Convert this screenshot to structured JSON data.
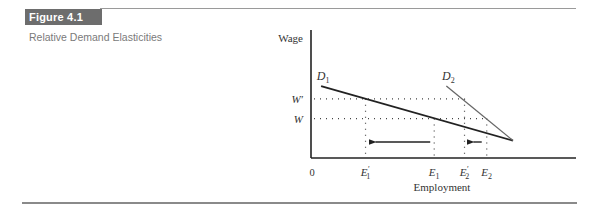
{
  "figure": {
    "label": "Figure 4.1",
    "title": "Relative Demand Elasticities"
  },
  "chart_data": {
    "type": "line",
    "title": "Relative Demand Elasticities",
    "xlabel": "Employment",
    "ylabel": "Wage",
    "origin_label": "0",
    "y_ticks": [
      {
        "label": "W'",
        "level": "high"
      },
      {
        "label": "W",
        "level": "low"
      }
    ],
    "x_ticks": [
      {
        "label": "E1'",
        "base": "E",
        "sub": "1",
        "prime": true
      },
      {
        "label": "E1",
        "base": "E",
        "sub": "1",
        "prime": false
      },
      {
        "label": "E2'",
        "base": "E",
        "sub": "2",
        "prime": true
      },
      {
        "label": "E2",
        "base": "E",
        "sub": "2",
        "prime": false
      }
    ],
    "series": [
      {
        "name": "D1",
        "base": "D",
        "sub": "1",
        "description": "Relatively elastic demand curve (flat)",
        "points": [
          [
            0.05,
            0.62
          ],
          [
            1.0,
            0.15
          ]
        ]
      },
      {
        "name": "D2",
        "base": "D",
        "sub": "2",
        "description": "Relatively inelastic demand curve (steep)",
        "points": [
          [
            0.67,
            0.62
          ],
          [
            1.0,
            0.15
          ]
        ]
      }
    ],
    "wage_levels": {
      "W_prime": 0.51,
      "W": 0.34
    },
    "employment_levels": {
      "E1_prime": 0.27,
      "E1": 0.61,
      "E2_prime": 0.76,
      "E2": 0.87
    },
    "arrows": [
      {
        "name": "shift-E1-to-E1prime",
        "from": "E1",
        "to": "E1'"
      },
      {
        "name": "shift-E2-to-E2prime",
        "from": "E2",
        "to": "E2'"
      }
    ],
    "grid": false,
    "legend": "none"
  }
}
